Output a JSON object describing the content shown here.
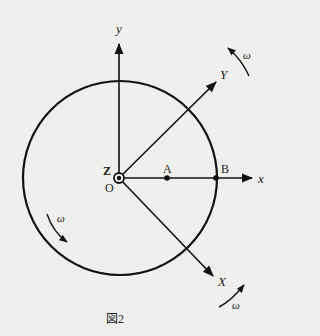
{
  "diagram": {
    "caption": "図2",
    "axes": {
      "x": "x",
      "y": "y",
      "X": "X",
      "Y": "Y",
      "Z": "Z"
    },
    "origin_label": "O",
    "points": [
      {
        "label": "A"
      },
      {
        "label": "B"
      }
    ],
    "rotation_labels": [
      "ω",
      "ω",
      "ω"
    ],
    "colors": {
      "ink": "#111111",
      "background": "#efefed"
    }
  }
}
